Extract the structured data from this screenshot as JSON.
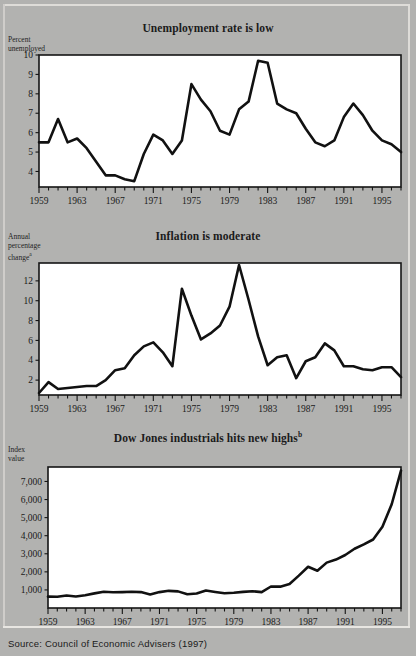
{
  "figure": {
    "source_note": "Source: Council of Economic Advisers (1997)",
    "background_color": "#b2b2b0",
    "plot_background_color": "#ffffff",
    "line_color": "#111111"
  },
  "charts": [
    {
      "id": "unemployment",
      "title": "Unemployment rate is low",
      "title_superscript": "",
      "y_caption_line1": "Percent",
      "y_caption_line2": "unemployed",
      "y_caption_superscript": "",
      "chart_data": {
        "type": "line",
        "title": "Unemployment rate is low",
        "xlabel": "",
        "ylabel": "Percent unemployed",
        "ylim": [
          3.2,
          10.0
        ],
        "xlim": [
          1959,
          1997
        ],
        "grid": false,
        "legend": "none",
        "ytick_labels": [
          "10",
          "9",
          "8",
          "7",
          "6",
          "5",
          "4"
        ],
        "ytick_values": [
          10,
          9,
          8,
          7,
          6,
          5,
          4
        ],
        "xtick_labels": [
          "1959",
          "1963",
          "1967",
          "1971",
          "1975",
          "1979",
          "1983",
          "1987",
          "1991",
          "1995"
        ],
        "xtick_values": [
          1959,
          1963,
          1967,
          1971,
          1975,
          1979,
          1983,
          1987,
          1991,
          1995
        ],
        "x": [
          1959,
          1960,
          1961,
          1962,
          1963,
          1964,
          1965,
          1966,
          1967,
          1968,
          1969,
          1970,
          1971,
          1972,
          1973,
          1974,
          1975,
          1976,
          1977,
          1978,
          1979,
          1980,
          1981,
          1982,
          1983,
          1984,
          1985,
          1986,
          1987,
          1988,
          1989,
          1990,
          1991,
          1992,
          1993,
          1994,
          1995,
          1996,
          1997
        ],
        "values": [
          5.5,
          5.5,
          6.7,
          5.5,
          5.7,
          5.2,
          4.5,
          3.8,
          3.8,
          3.6,
          3.5,
          4.9,
          5.9,
          5.6,
          4.9,
          5.6,
          8.5,
          7.7,
          7.1,
          6.1,
          5.9,
          7.2,
          7.6,
          9.7,
          9.6,
          7.5,
          7.2,
          7.0,
          6.2,
          5.5,
          5.3,
          5.6,
          6.8,
          7.5,
          6.9,
          6.1,
          5.6,
          5.4,
          5.0
        ]
      }
    },
    {
      "id": "inflation",
      "title": "Inflation is moderate",
      "title_superscript": "",
      "y_caption_line1": "Annual",
      "y_caption_line2": "percentage",
      "y_caption_line3": "change",
      "y_caption_superscript": "a",
      "chart_data": {
        "type": "line",
        "title": "Inflation is moderate",
        "xlabel": "",
        "ylabel": "Annual percentage change",
        "ylim": [
          0.5,
          13.8
        ],
        "xlim": [
          1959,
          1997
        ],
        "grid": false,
        "legend": "none",
        "ytick_labels": [
          "12",
          "10",
          "8",
          "6",
          "4",
          "2"
        ],
        "ytick_values": [
          12,
          10,
          8,
          6,
          4,
          2
        ],
        "xtick_labels": [
          "1959",
          "1963",
          "1967",
          "1971",
          "1975",
          "1979",
          "1983",
          "1987",
          "1991",
          "1995"
        ],
        "xtick_values": [
          1959,
          1963,
          1967,
          1971,
          1975,
          1979,
          1983,
          1987,
          1991,
          1995
        ],
        "x": [
          1959,
          1960,
          1961,
          1962,
          1963,
          1964,
          1965,
          1966,
          1967,
          1968,
          1969,
          1970,
          1971,
          1972,
          1973,
          1974,
          1975,
          1976,
          1977,
          1978,
          1979,
          1980,
          1981,
          1982,
          1983,
          1984,
          1985,
          1986,
          1987,
          1988,
          1989,
          1990,
          1991,
          1992,
          1993,
          1994,
          1995,
          1996,
          1997
        ],
        "values": [
          0.7,
          1.8,
          1.1,
          1.2,
          1.3,
          1.4,
          1.4,
          2.0,
          3.0,
          3.2,
          4.5,
          5.4,
          5.8,
          4.8,
          3.4,
          11.2,
          8.5,
          6.1,
          6.7,
          7.5,
          9.4,
          13.6,
          10.1,
          6.4,
          3.5,
          4.3,
          4.5,
          2.2,
          3.9,
          4.3,
          5.7,
          5.0,
          3.4,
          3.4,
          3.1,
          3.0,
          3.3,
          3.3,
          2.3
        ]
      }
    },
    {
      "id": "dow-jones",
      "title": "Dow Jones industrials hits new highs",
      "title_superscript": "b",
      "y_caption_line1": "Index",
      "y_caption_line2": "value",
      "y_caption_superscript": "",
      "chart_data": {
        "type": "line",
        "title": "Dow Jones industrials hits new highs",
        "xlabel": "",
        "ylabel": "Index value",
        "ylim": [
          0,
          7800
        ],
        "xlim": [
          1959,
          1997
        ],
        "grid": false,
        "legend": "none",
        "ytick_labels": [
          "7,000",
          "6,000",
          "5,000",
          "4,000",
          "3,000",
          "2,000",
          "1,000"
        ],
        "ytick_values": [
          7000,
          6000,
          5000,
          4000,
          3000,
          2000,
          1000
        ],
        "xtick_labels": [
          "1959",
          "1963",
          "1967",
          "1971",
          "1975",
          "1979",
          "1983",
          "1987",
          "1991",
          "1995"
        ],
        "xtick_values": [
          1959,
          1963,
          1967,
          1971,
          1975,
          1979,
          1983,
          1987,
          1991,
          1995
        ],
        "x": [
          1959,
          1960,
          1961,
          1962,
          1963,
          1964,
          1965,
          1966,
          1967,
          1968,
          1969,
          1970,
          1971,
          1972,
          1973,
          1974,
          1975,
          1976,
          1977,
          1978,
          1979,
          1980,
          1981,
          1982,
          1983,
          1984,
          1985,
          1986,
          1987,
          1988,
          1989,
          1990,
          1991,
          1992,
          1993,
          1994,
          1995,
          1996,
          1997
        ],
        "values": [
          630,
          620,
          690,
          640,
          710,
          810,
          900,
          870,
          880,
          900,
          880,
          750,
          880,
          950,
          920,
          760,
          800,
          970,
          890,
          820,
          840,
          890,
          930,
          880,
          1190,
          1180,
          1330,
          1790,
          2280,
          2060,
          2510,
          2680,
          2930,
          3280,
          3520,
          3790,
          4490,
          5740,
          7600
        ]
      }
    }
  ]
}
